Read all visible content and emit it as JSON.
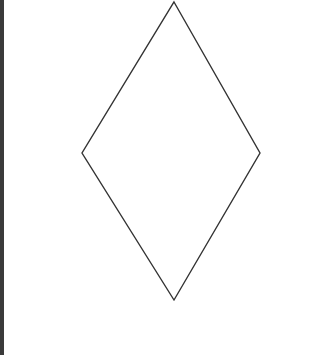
{
  "diagram": {
    "shape": "diamond",
    "stroke_color": "#333333",
    "fill_color": "#ffffff",
    "stroke_width": 1.4,
    "vertices": {
      "top": [
        174,
        2
      ],
      "right": [
        260,
        153
      ],
      "bottom": [
        174,
        300
      ],
      "left": [
        82,
        153
      ]
    }
  },
  "frame": {
    "left_border_color": "#3a3a3a",
    "background": "#ffffff"
  }
}
